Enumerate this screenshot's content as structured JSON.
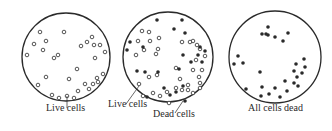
{
  "diagram": {
    "title": "",
    "stroke_color": "#2a2a2a",
    "panels": [
      {
        "id": "panel-live",
        "circle": {
          "cx": 66,
          "cy": 57,
          "r": 44
        },
        "caption": "Live cells",
        "live_cells": [
          [
            40,
            32
          ],
          [
            46,
            41
          ],
          [
            34,
            44
          ],
          [
            43,
            50
          ],
          [
            27,
            55
          ],
          [
            64,
            32
          ],
          [
            58,
            55
          ],
          [
            54,
            58
          ],
          [
            81,
            46
          ],
          [
            87,
            42
          ],
          [
            94,
            45
          ],
          [
            100,
            45
          ],
          [
            92,
            37
          ],
          [
            105,
            52
          ],
          [
            95,
            58
          ],
          [
            46,
            77
          ],
          [
            38,
            85
          ],
          [
            69,
            79
          ],
          [
            77,
            69
          ],
          [
            103,
            74
          ],
          [
            97,
            78
          ],
          [
            93,
            84
          ],
          [
            85,
            84
          ],
          [
            98,
            82
          ],
          [
            89,
            89
          ],
          [
            78,
            91
          ],
          [
            74,
            98
          ],
          [
            52,
            95
          ],
          [
            59,
            98
          ],
          [
            67,
            96
          ]
        ],
        "dead_cells": [],
        "pointers": [
          {
            "from": [
              67,
              96
            ],
            "to": [
              67,
              108
            ]
          }
        ],
        "caption_pos": {
          "x": 46,
          "y": 111
        }
      },
      {
        "id": "panel-mixed",
        "circle": {
          "cx": 168,
          "cy": 57,
          "r": 45
        },
        "captions": [
          "Live cells",
          "Dead cells"
        ],
        "live_cells": [
          [
            142,
            31
          ],
          [
            149,
            32
          ],
          [
            138,
            41
          ],
          [
            150,
            41
          ],
          [
            136,
            55
          ],
          [
            144,
            50
          ],
          [
            159,
            38
          ],
          [
            158,
            49
          ],
          [
            156,
            54
          ],
          [
            182,
            42
          ],
          [
            193,
            41
          ],
          [
            197,
            45
          ],
          [
            190,
            42
          ],
          [
            200,
            49
          ],
          [
            205,
            56
          ],
          [
            196,
            60
          ],
          [
            176,
            68
          ],
          [
            157,
            75
          ],
          [
            149,
            77
          ],
          [
            139,
            84
          ],
          [
            180,
            79
          ],
          [
            193,
            70
          ],
          [
            202,
            70
          ],
          [
            199,
            77
          ],
          [
            200,
            83
          ],
          [
            200,
            88
          ],
          [
            188,
            85
          ],
          [
            176,
            88
          ],
          [
            167,
            92
          ],
          [
            160,
            96
          ],
          [
            153,
            93
          ],
          [
            143,
            96
          ],
          [
            169,
            103
          ],
          [
            182,
            90
          ],
          [
            188,
            90
          ],
          [
            193,
            93
          ]
        ],
        "dead_cells": [
          [
            157,
            20
          ],
          [
            182,
            20
          ],
          [
            174,
            29
          ],
          [
            185,
            33
          ],
          [
            130,
            42
          ],
          [
            127,
            50
          ],
          [
            143,
            47
          ],
          [
            200,
            47
          ],
          [
            205,
            51
          ],
          [
            198,
            55
          ],
          [
            202,
            62
          ],
          [
            183,
            55
          ],
          [
            191,
            62
          ],
          [
            179,
            69
          ],
          [
            137,
            71
          ],
          [
            145,
            72
          ],
          [
            158,
            72
          ],
          [
            176,
            92
          ],
          [
            170,
            95
          ],
          [
            183,
            86
          ],
          [
            164,
            88
          ],
          [
            147,
            97
          ],
          [
            185,
            101
          ]
        ],
        "pointers": [
          {
            "from": [
              139,
              86
            ],
            "to": [
              126,
              104
            ]
          },
          {
            "from": [
              183,
              101
            ],
            "to": [
              175,
              113
            ]
          }
        ],
        "caption_positions": [
          {
            "x": 108,
            "y": 105
          },
          {
            "x": 153,
            "y": 115
          }
        ]
      },
      {
        "id": "panel-dead",
        "circle": {
          "cx": 275,
          "cy": 57,
          "r": 46
        },
        "caption": "All cells dead",
        "live_cells": [],
        "dead_cells": [
          [
            268,
            27
          ],
          [
            262,
            34
          ],
          [
            266,
            34
          ],
          [
            268,
            35
          ],
          [
            275,
            37
          ],
          [
            283,
            41
          ],
          [
            288,
            33
          ],
          [
            234,
            64
          ],
          [
            238,
            56
          ],
          [
            243,
            63
          ],
          [
            260,
            72
          ],
          [
            246,
            89
          ],
          [
            262,
            87
          ],
          [
            261,
            96
          ],
          [
            269,
            94
          ],
          [
            275,
            88
          ],
          [
            280,
            97
          ],
          [
            285,
            81
          ],
          [
            287,
            91
          ],
          [
            294,
            83
          ],
          [
            298,
            86
          ],
          [
            297,
            77
          ],
          [
            302,
            73
          ],
          [
            305,
            67
          ],
          [
            304,
            59
          ],
          [
            296,
            64
          ],
          [
            294,
            71
          ]
        ],
        "pointers": [],
        "caption_pos": {
          "x": 248,
          "y": 111
        }
      }
    ]
  }
}
